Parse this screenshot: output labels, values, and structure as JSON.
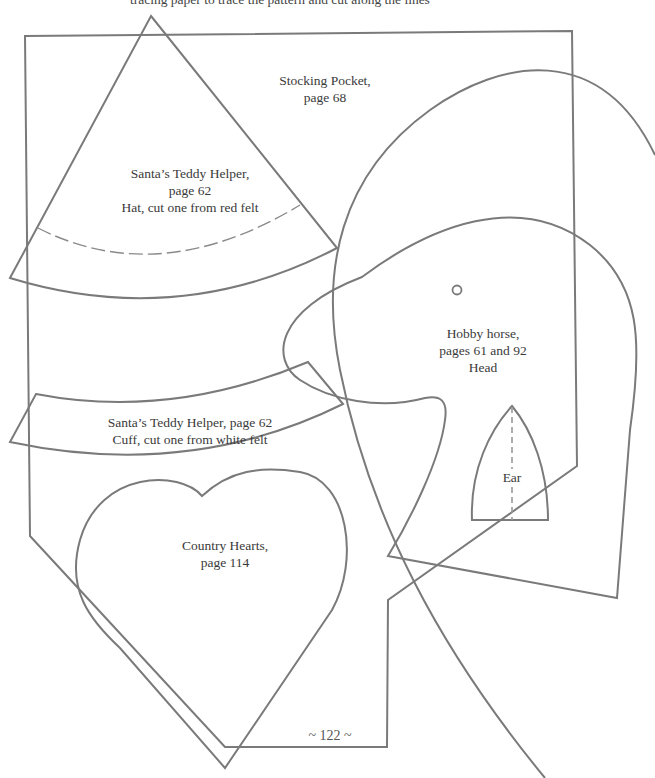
{
  "page": {
    "top_text": "tracing paper to trace the pattern and cut along the lines",
    "folio": "~ 122 ~",
    "stroke_color": "#7a7a7a",
    "text_color": "#3a3a3a"
  },
  "pieces": {
    "stocking_pocket": {
      "line1": "Stocking Pocket,",
      "line2": "page 68"
    },
    "santa_hat": {
      "line1": "Santa’s Teddy Helper,",
      "line2": "page 62",
      "line3": "Hat, cut one from red felt"
    },
    "santa_cuff": {
      "line1": "Santa’s Teddy Helper, page 62",
      "line2": "Cuff, cut one from white felt"
    },
    "hobby_horse_head": {
      "line1": "Hobby horse,",
      "line2": "pages 61 and 92",
      "line3": "Head"
    },
    "hobby_horse_ear": {
      "line1": "Ear"
    },
    "country_hearts": {
      "line1": "Country Hearts,",
      "line2": "page 114"
    }
  }
}
